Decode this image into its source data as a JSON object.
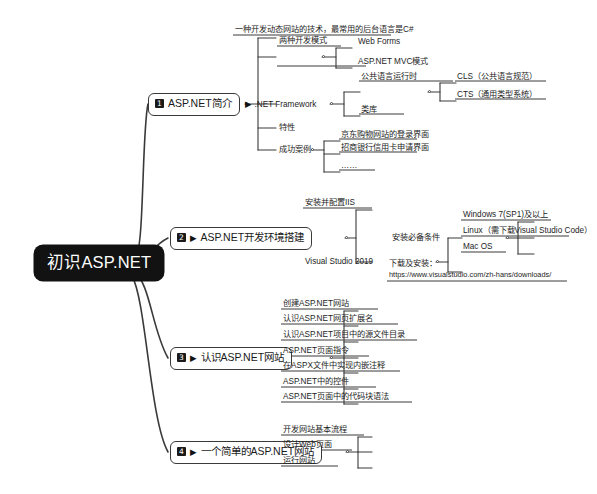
{
  "map": {
    "root": {
      "label": "初识ASP.NET"
    },
    "branches": [
      {
        "number": "1",
        "label": "ASP.NET简介",
        "flag": "",
        "children": [
          {
            "label": "一种开发动态网站的技术，最常用的后台语言是C#",
            "children": []
          },
          {
            "label": "两种开发模式",
            "children": [
              {
                "label": "Web Forms"
              },
              {
                "label": "ASP.NET MVC模式"
              }
            ]
          },
          {
            "label": ".NET Framework",
            "flag": "▶",
            "children": [
              {
                "label": "公共语言运行时",
                "children": [
                  {
                    "label": "CLS（公共语言规范）"
                  },
                  {
                    "label": "CTS（通用类型系统）"
                  }
                ]
              },
              {
                "label": "类库"
              }
            ]
          },
          {
            "label": "特性",
            "children": []
          },
          {
            "label": "成功案例",
            "children": [
              {
                "label": "京东购物网站的登录界面"
              },
              {
                "label": "招商银行信用卡申请界面"
              },
              {
                "label": "……"
              }
            ]
          }
        ]
      },
      {
        "number": "2",
        "label": "ASP.NET开发环境搭建",
        "flag": "▶",
        "children": [
          {
            "label": "安装并配置IIS",
            "children": []
          },
          {
            "label": "Visual Studio 2019",
            "children": [
              {
                "label": "安装必备条件",
                "children": [
                  {
                    "label": "Windows 7(SP1)及以上"
                  },
                  {
                    "label": "Linux（需下载Visual Studio Code）"
                  },
                  {
                    "label": "Mac OS"
                  }
                ]
              },
              {
                "label": "下载及安装：",
                "label2": "https://www.visualstudio.com/zh-hans/downloads/"
              }
            ]
          }
        ]
      },
      {
        "number": "3",
        "label": "认识ASP.NET网站",
        "flag": "▶",
        "children": [
          {
            "label": "创建ASP.NET网站"
          },
          {
            "label": "认识ASP.NET网页扩展名"
          },
          {
            "label": "认识ASP.NET项目中的源文件目录"
          },
          {
            "label": "ASP.NET页面指令"
          },
          {
            "label": "在ASPX文件中实现内嵌注释"
          },
          {
            "label": "ASP.NET中的控件"
          },
          {
            "label": "ASP.NET页面中的代码块语法"
          }
        ]
      },
      {
        "number": "4",
        "label": "一个简单的ASP.NET网站",
        "flag": "▶",
        "children": [
          {
            "label": "开发网站基本流程"
          },
          {
            "label": "设计Web页面"
          },
          {
            "label": "运行网站"
          }
        ]
      }
    ]
  },
  "colors": {
    "root_bg": "#121212",
    "root_fg": "#ffffff",
    "line": "#3a3a3a",
    "text": "#1d1d1d",
    "page_bg": "#ffffff"
  }
}
